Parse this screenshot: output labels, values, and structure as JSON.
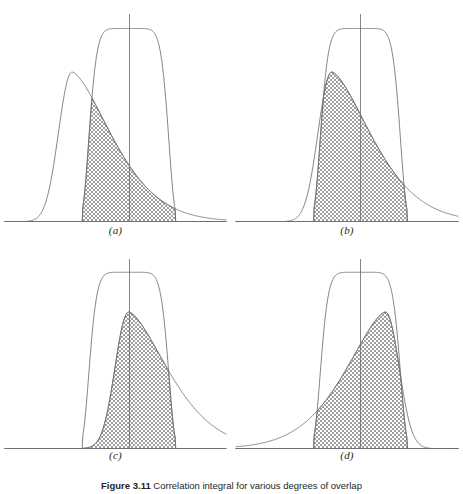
{
  "figure": {
    "caption_number": "Figure 3.11",
    "caption_text": "Correlation integral for various degrees of overlap",
    "background_color": "#ffffff",
    "curve_color": "#6f6f72",
    "axis_color": "#6f6f72",
    "hatch_color": "#767679",
    "label_color": "#231f20"
  },
  "panels": [
    {
      "id": "a",
      "label": "(a)",
      "description": "Broad flat-topped curve centered on the vertical reference line with a narrow asymmetric curve far to the left; overlap region is a small hatched sliver."
    },
    {
      "id": "b",
      "label": "(b)",
      "description": "Asymmetric curve shifted toward the center producing a moderate hatched overlap region."
    },
    {
      "id": "c",
      "label": "(c)",
      "description": "Both curves centered on the vertical reference line giving the maximum hatched overlap region."
    },
    {
      "id": "d",
      "label": "(d)",
      "description": "Asymmetric curve mirrored to the right of the vertical reference line; overlap region is again a narrow hatched sliver."
    }
  ],
  "chart_data": {
    "type": "area",
    "title": "Correlation integral for various degrees of overlap",
    "xlabel": "",
    "ylabel": "",
    "xlim": [
      0,
      1
    ],
    "ylim": [
      0,
      1
    ],
    "grid": false,
    "legend": "none",
    "shared": {
      "flat_curve": {
        "name": "flat-topped curve",
        "center": 0.56,
        "half_width": 0.21,
        "plateau_half_width": 0.075,
        "peak": 0.93,
        "shape": "super-gaussian plateau"
      },
      "skew_curve": {
        "name": "asymmetric curve",
        "peak_height": 0.72,
        "rise_width": 0.085,
        "fall_width": 0.26,
        "shape": "steep rise, long trailing fall"
      },
      "reference_line": {
        "name": "vertical reference line",
        "x": 0.56,
        "top": 1.0
      },
      "baseline": {
        "name": "horizontal axis",
        "x_start": 0.02,
        "x_end": 0.98
      }
    },
    "panels": [
      {
        "id": "a",
        "label": "(a)",
        "skew_peak_x": 0.305,
        "skew_mirrored": false,
        "overlap_peak_height": 0.145,
        "overlap_area_relative": 0.12
      },
      {
        "id": "b",
        "label": "(b)",
        "skew_peak_x": 0.432,
        "skew_mirrored": false,
        "overlap_peak_height": 0.345,
        "overlap_area_relative": 0.46
      },
      {
        "id": "c",
        "label": "(c)",
        "skew_peak_x": 0.56,
        "skew_mirrored": false,
        "overlap_peak_height": 0.46,
        "overlap_area_relative": 1.0
      },
      {
        "id": "d",
        "label": "(d)",
        "skew_peak_x": 0.672,
        "skew_mirrored": true,
        "overlap_peak_height": 0.2,
        "overlap_area_relative": 0.16
      }
    ]
  }
}
